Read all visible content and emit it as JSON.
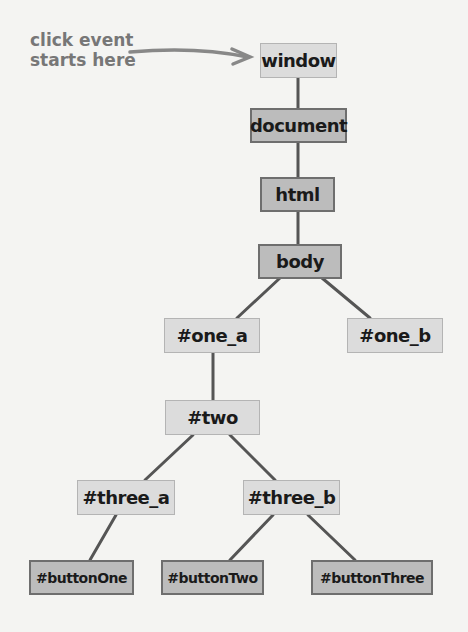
{
  "annotation": {
    "line1": "click event",
    "line2": "starts here",
    "arrow_target": "window"
  },
  "nodes": {
    "window": "window",
    "document": "document",
    "html": "html",
    "body": "body",
    "one_a": "#one_a",
    "one_b": "#one_b",
    "two": "#two",
    "three_a": "#three_a",
    "three_b": "#three_b",
    "buttonOne": "#buttonOne",
    "buttonTwo": "#buttonTwo",
    "buttonThree": "#buttonThree"
  },
  "edges": [
    [
      "window",
      "document"
    ],
    [
      "document",
      "html"
    ],
    [
      "html",
      "body"
    ],
    [
      "body",
      "one_a"
    ],
    [
      "body",
      "one_b"
    ],
    [
      "one_a",
      "two"
    ],
    [
      "two",
      "three_a"
    ],
    [
      "two",
      "three_b"
    ],
    [
      "three_a",
      "buttonOne"
    ],
    [
      "three_b",
      "buttonTwo"
    ],
    [
      "three_b",
      "buttonThree"
    ]
  ],
  "colors": {
    "light_fill": "#dcdcdc",
    "dark_fill": "#bcbcbc",
    "line": "#555555",
    "annotation": "#777777"
  }
}
